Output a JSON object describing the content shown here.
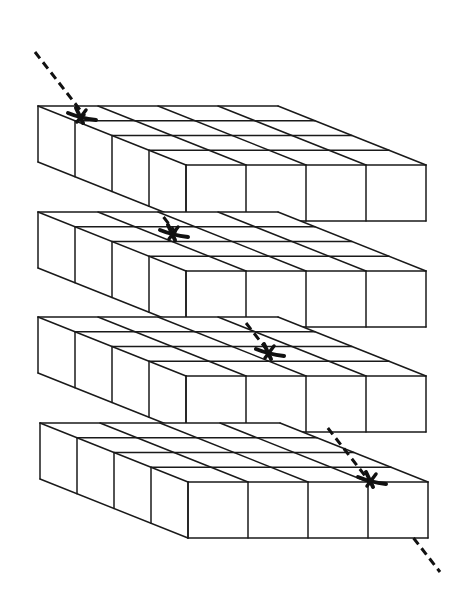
{
  "diagram": {
    "colors": {
      "background": "#ffffff",
      "stroke": "#1a1a1a",
      "marker": "#111111"
    },
    "grid": {
      "cols": 4,
      "rows": 4
    },
    "geometry": {
      "cell_width": 60,
      "depth_step": [
        37,
        14.75
      ],
      "slab_height": 56
    },
    "slabs": [
      {
        "id": "slab-1",
        "origin": [
          38,
          106
        ],
        "marker": [
          80,
          116
        ]
      },
      {
        "id": "slab-2",
        "origin": [
          38,
          212
        ],
        "marker": [
          172,
          233
        ]
      },
      {
        "id": "slab-3",
        "origin": [
          38,
          317
        ],
        "marker": [
          268,
          352
        ]
      },
      {
        "id": "slab-4",
        "origin": [
          40,
          423
        ],
        "marker": [
          370,
          480
        ]
      }
    ],
    "dashed_line": {
      "from": [
        35,
        52
      ],
      "to": [
        440,
        572
      ]
    }
  }
}
